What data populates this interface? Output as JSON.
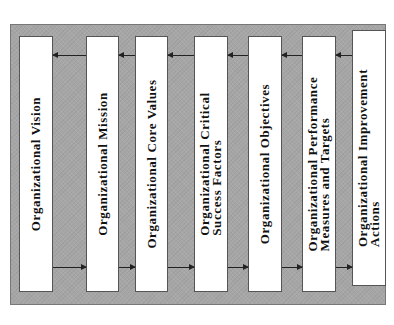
{
  "diagram": {
    "layout": "horizontal sequence of vertical boxes with rotated text; feed-forward arrows along bottom (left to right) and feedback arrows along top (right to left)",
    "colors": {
      "background": "#a6a6a6",
      "box_fill": "#ffffff",
      "arrow": "#222222"
    },
    "boxes": [
      {
        "label": "Organizational Vision"
      },
      {
        "label": "Organizational Mission"
      },
      {
        "label": "Organizational Core Values"
      },
      {
        "label": "Organizational Critical\nSuccess Factors"
      },
      {
        "label": "Organizational Objectives"
      },
      {
        "label": "Organizational Performance\nMeasures and Targets"
      },
      {
        "label": "Organizational Improvement\nActions"
      }
    ],
    "arrows": {
      "forward": "bottom, left-to-right between consecutive boxes",
      "feedback": "top, right-to-left between consecutive boxes"
    }
  }
}
